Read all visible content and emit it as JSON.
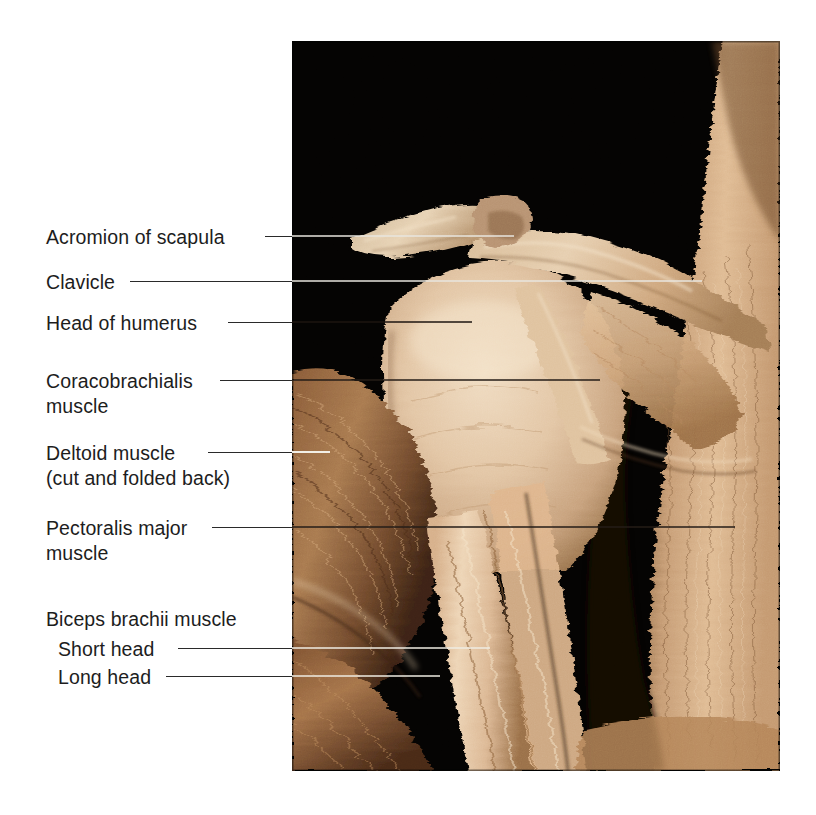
{
  "figure": {
    "background_color": "#ffffff",
    "text_color": "#1d1d1d",
    "photo": {
      "x": 292,
      "y": 41,
      "width": 488,
      "height": 730,
      "background_color": "#000000",
      "tissue_light": "#e2c3a2",
      "tissue_mid": "#c49a72",
      "tissue_dark": "#6b4429",
      "tissue_deep": "#2e1a0f"
    }
  },
  "labels": [
    {
      "name": "acromion-of-scapula",
      "line1": "Acromion of scapula",
      "line2": "",
      "text_x": 46,
      "text_y": 225,
      "leader": {
        "x": 265,
        "y": 236,
        "width": 27
      },
      "leader_in": {
        "x": 0,
        "y": 195,
        "width": 222,
        "style": "light"
      }
    },
    {
      "name": "clavicle",
      "line1": "Clavicle",
      "line2": "",
      "text_x": 46,
      "text_y": 270,
      "leader": {
        "x": 130,
        "y": 281,
        "width": 162
      },
      "leader_in": {
        "x": 0,
        "y": 240,
        "width": 410,
        "style": "light"
      }
    },
    {
      "name": "head-of-humerus",
      "line1": "Head of humerus",
      "line2": "",
      "text_x": 46,
      "text_y": 311,
      "leader": {
        "x": 228,
        "y": 322,
        "width": 64
      },
      "leader_in": {
        "x": 0,
        "y": 281,
        "width": 180,
        "style": "light"
      }
    },
    {
      "name": "coracobrachialis-muscle",
      "line1": "Coracobrachialis",
      "line2": "muscle",
      "text_x": 46,
      "text_y": 369,
      "leader": {
        "x": 220,
        "y": 380,
        "width": 72
      },
      "leader_in": {
        "x": 0,
        "y": 339,
        "width": 308,
        "style": "dark"
      }
    },
    {
      "name": "deltoid-muscle",
      "line1": "Deltoid muscle",
      "line2": "(cut and folded back)",
      "text_x": 46,
      "text_y": 441,
      "leader": {
        "x": 208,
        "y": 452,
        "width": 84
      },
      "leader_in": {
        "x": 0,
        "y": 411,
        "width": 38,
        "style": "light"
      }
    },
    {
      "name": "pectoralis-major-muscle",
      "line1": "Pectoralis major",
      "line2": "muscle",
      "text_x": 46,
      "text_y": 516,
      "leader": {
        "x": 212,
        "y": 527,
        "width": 80
      },
      "leader_in": {
        "x": 0,
        "y": 486,
        "width": 443,
        "style": "dark"
      }
    },
    {
      "name": "biceps-brachii-muscle",
      "line1": "Biceps brachii muscle",
      "line2": "",
      "text_x": 46,
      "text_y": 607,
      "leader": null,
      "leader_in": null
    },
    {
      "name": "biceps-short-head",
      "line1": "Short head",
      "line2": "",
      "text_x": 58,
      "text_y": 637,
      "leader": {
        "x": 178,
        "y": 648,
        "width": 114
      },
      "leader_in": {
        "x": 0,
        "y": 607,
        "width": 198,
        "style": "light"
      }
    },
    {
      "name": "biceps-long-head",
      "line1": "Long head",
      "line2": "",
      "text_x": 58,
      "text_y": 665,
      "leader": {
        "x": 166,
        "y": 676,
        "width": 126
      },
      "leader_in": {
        "x": 0,
        "y": 635,
        "width": 148,
        "style": "light"
      }
    }
  ]
}
